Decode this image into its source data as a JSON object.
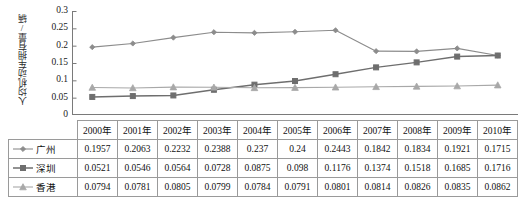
{
  "chart_data": {
    "type": "line",
    "title": "",
    "xlabel": "",
    "ylabel": "人均机动车拥有量/辆",
    "ylim": [
      0,
      0.3
    ],
    "yticks": [
      0,
      0.05,
      0.1,
      0.15,
      0.2,
      0.25,
      0.3
    ],
    "ytick_labels": [
      "0",
      "0.05",
      "0.1",
      "0.15",
      "0.2",
      "0.25",
      "0.3"
    ],
    "grid": false,
    "legend_position": "table-row-headers",
    "categories": [
      "2000年",
      "2001年",
      "2002年",
      "2003年",
      "2004年",
      "2005年",
      "2006年",
      "2007年",
      "2008年",
      "2009年",
      "2010年"
    ],
    "series": [
      {
        "name": "广州",
        "marker": "diamond",
        "color": "#8c8c8c",
        "values": [
          0.1957,
          0.2063,
          0.2232,
          0.2388,
          0.237,
          0.24,
          0.2443,
          0.1842,
          0.1834,
          0.1921,
          0.1715
        ],
        "value_labels": [
          "0.1957",
          "0.2063",
          "0.2232",
          "0.2388",
          "0.237",
          "0.24",
          "0.2443",
          "0.1842",
          "0.1834",
          "0.1921",
          "0.1715"
        ]
      },
      {
        "name": "深圳",
        "marker": "square",
        "color": "#6e6e6e",
        "values": [
          0.0521,
          0.0546,
          0.0564,
          0.0728,
          0.0875,
          0.098,
          0.1176,
          0.1374,
          0.1518,
          0.1685,
          0.1716
        ],
        "value_labels": [
          "0.0521",
          "0.0546",
          "0.0564",
          "0.0728",
          "0.0875",
          "0.098",
          "0.1176",
          "0.1374",
          "0.1518",
          "0.1685",
          "0.1716"
        ]
      },
      {
        "name": "香港",
        "marker": "triangle",
        "color": "#a8a8a8",
        "values": [
          0.0794,
          0.0781,
          0.0805,
          0.0799,
          0.0784,
          0.0791,
          0.0801,
          0.0814,
          0.0826,
          0.0835,
          0.0862
        ],
        "value_labels": [
          "0.0794",
          "0.0781",
          "0.0805",
          "0.0799",
          "0.0784",
          "0.0791",
          "0.0801",
          "0.0814",
          "0.0826",
          "0.0835",
          "0.0862"
        ]
      }
    ]
  },
  "table": {
    "corner_label": "",
    "column_headers": [
      "2000年",
      "2001年",
      "2002年",
      "2003年",
      "2004年",
      "2005年",
      "2006年",
      "2007年",
      "2008年",
      "2009年",
      "2010年"
    ],
    "rows": [
      {
        "label": "广州",
        "cells": [
          "0.1957",
          "0.2063",
          "0.2232",
          "0.2388",
          "0.237",
          "0.24",
          "0.2443",
          "0.1842",
          "0.1834",
          "0.1921",
          "0.1715"
        ]
      },
      {
        "label": "深圳",
        "cells": [
          "0.0521",
          "0.0546",
          "0.0564",
          "0.0728",
          "0.0875",
          "0.098",
          "0.1176",
          "0.1374",
          "0.1518",
          "0.1685",
          "0.1716"
        ]
      },
      {
        "label": "香港",
        "cells": [
          "0.0794",
          "0.0781",
          "0.0805",
          "0.0799",
          "0.0784",
          "0.0791",
          "0.0801",
          "0.0814",
          "0.0826",
          "0.0835",
          "0.0862"
        ]
      }
    ]
  },
  "colors": {
    "axis": "#7a7a7a",
    "grid_border": "#9a9a9a",
    "guangzhou": "#8c8c8c",
    "shenzhen": "#6e6e6e",
    "hongkong": "#a8a8a8",
    "text": "#111111"
  }
}
